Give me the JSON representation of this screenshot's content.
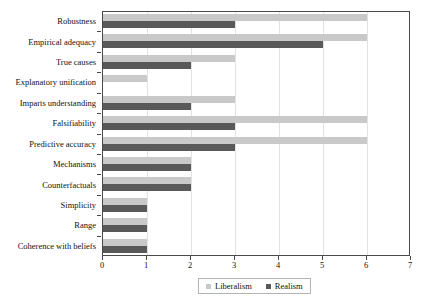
{
  "chart_data": {
    "type": "bar",
    "orientation": "horizontal",
    "title": "",
    "xlabel": "",
    "ylabel": "",
    "xlim": [
      0,
      7
    ],
    "xticks": [
      "0",
      "1",
      "2",
      "3",
      "4",
      "5",
      "6",
      "7"
    ],
    "grid": true,
    "grid_axis": "x",
    "legend_position": "bottom",
    "categories": [
      "Robustness",
      "Empirical adequacy",
      "True causes",
      "Explanatory unification",
      "Imparts understanding",
      "Falsifiability",
      "Predictive accuracy",
      "Mechanisms",
      "Counterfactuals",
      "Simplicity",
      "Range",
      "Coherence with beliefs"
    ],
    "series": [
      {
        "name": "Liberalism",
        "color": "#c9c9c9",
        "values": [
          6,
          6,
          3,
          1,
          3,
          6,
          6,
          2,
          2,
          1,
          1,
          1
        ]
      },
      {
        "name": "Realism",
        "color": "#595959",
        "values": [
          3,
          5,
          2,
          0,
          2,
          3,
          3,
          2,
          2,
          1,
          1,
          1
        ]
      }
    ]
  },
  "legend": {
    "entries": [
      {
        "label": "Liberalism"
      },
      {
        "label": "Realism"
      }
    ]
  }
}
